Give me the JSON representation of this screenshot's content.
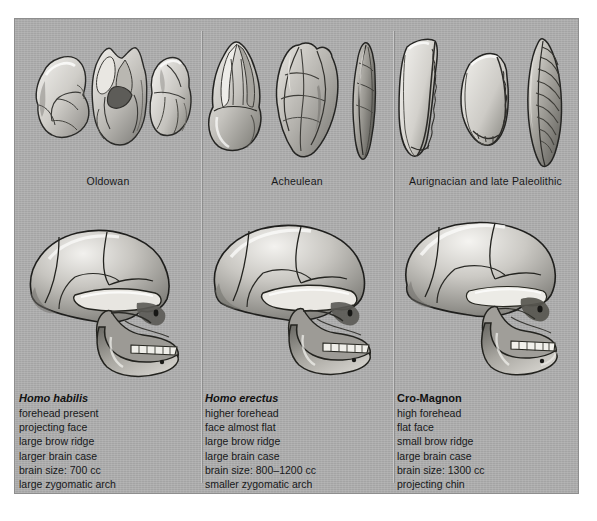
{
  "figure": {
    "background_color": "#a9a9a9",
    "page_background": "#ffffff"
  },
  "columns": [
    {
      "tool_label": "Oldowan",
      "tool_icons": [
        "chopper-core-tool-icon",
        "flaked-core-tool-icon",
        "pebble-chopper-tool-icon"
      ],
      "skull_icon": "homo-habilis-skull-icon",
      "title": "Homo habilis",
      "title_style": "italic",
      "traits": [
        "forehead present",
        "projecting face",
        "large brow ridge",
        "larger brain case",
        "brain size: 700 cc",
        "large zygomatic arch"
      ]
    },
    {
      "tool_label": "Acheulean",
      "tool_icons": [
        "pointed-handaxe-icon",
        "oval-handaxe-icon",
        "slender-pick-icon"
      ],
      "skull_icon": "homo-erectus-skull-icon",
      "title": "Homo erectus",
      "title_style": "italic",
      "traits": [
        "higher forehead",
        "face almost flat",
        "large brow ridge",
        "large brain case",
        "brain size: 800–1200 cc",
        "smaller zygomatic arch"
      ]
    },
    {
      "tool_label": "Aurignacian and late Paleolithic",
      "tool_icons": [
        "curved-blade-icon",
        "broad-flake-blade-icon",
        "laurel-leaf-point-icon"
      ],
      "skull_icon": "cro-magnon-skull-icon",
      "title": "Cro-Magnon",
      "title_style": "roman",
      "traits": [
        "high forehead",
        "flat face",
        "small brow ridge",
        "large brain case",
        "brain size: 1300 cc",
        "projecting chin"
      ]
    }
  ]
}
